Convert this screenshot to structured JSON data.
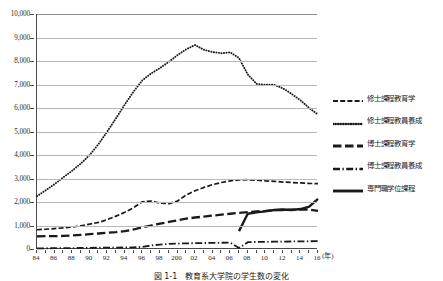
{
  "chart_data": {
    "type": "line",
    "title": "",
    "xlabel": "(年)",
    "ylabel": "",
    "ylim": [
      0,
      10000
    ],
    "ytick_values": [
      0,
      1000,
      2000,
      3000,
      4000,
      5000,
      6000,
      7000,
      8000,
      9000,
      10000
    ],
    "ytick_labels": [
      "0",
      "1,000",
      "2,000",
      "3,000",
      "4,000",
      "5,000",
      "6,000",
      "7,000",
      "8,000",
      "9,000",
      "10,000"
    ],
    "grid": true,
    "legend_position": "right",
    "x": [
      1984,
      1985,
      1986,
      1987,
      1988,
      1989,
      1990,
      1991,
      1992,
      1993,
      1994,
      1995,
      1996,
      1997,
      1998,
      1999,
      2000,
      2001,
      2002,
      2003,
      2004,
      2005,
      2006,
      2007,
      2008,
      2009,
      2010,
      2011,
      2012,
      2013,
      2014,
      2015,
      2016
    ],
    "xtick_labels": [
      "84",
      "86",
      "88",
      "90",
      "92",
      "94",
      "96",
      "98",
      "200",
      "02",
      "04",
      "06",
      "08",
      "10",
      "12",
      "14",
      "16"
    ],
    "xtick_years": [
      1984,
      1986,
      1988,
      1990,
      1992,
      1994,
      1996,
      1998,
      2000,
      2002,
      2004,
      2006,
      2008,
      2010,
      2012,
      2014,
      2016
    ],
    "series": [
      {
        "name": "修士課程教育学",
        "style": "dashed",
        "values": [
          820,
          840,
          870,
          900,
          930,
          990,
          1060,
          1130,
          1250,
          1400,
          1560,
          1760,
          2010,
          2040,
          1950,
          1930,
          2040,
          2300,
          2480,
          2620,
          2740,
          2830,
          2900,
          2940,
          2950,
          2930,
          2900,
          2880,
          2850,
          2830,
          2810,
          2790,
          2780
        ]
      },
      {
        "name": "修士課程教員養成",
        "style": "dotted",
        "values": [
          2250,
          2500,
          2760,
          3050,
          3330,
          3640,
          4000,
          4460,
          5000,
          5560,
          6150,
          6700,
          7180,
          7470,
          7700,
          7960,
          8250,
          8500,
          8680,
          8480,
          8380,
          8330,
          8370,
          8130,
          7430,
          7030,
          6990,
          6990,
          6840,
          6600,
          6330,
          6000,
          5720
        ]
      },
      {
        "name": "博士課程教育学",
        "style": "longdash",
        "values": [
          540,
          545,
          550,
          555,
          575,
          600,
          630,
          660,
          690,
          720,
          760,
          830,
          920,
          1000,
          1080,
          1150,
          1220,
          1290,
          1340,
          1380,
          1420,
          1460,
          1500,
          1540,
          1570,
          1600,
          1620,
          1650,
          1660,
          1670,
          1680,
          1680,
          1620
        ]
      },
      {
        "name": "博士課程教員養成",
        "style": "dashdot",
        "values": [
          30,
          30,
          35,
          35,
          40,
          45,
          50,
          55,
          60,
          60,
          65,
          70,
          90,
          150,
          190,
          215,
          230,
          240,
          250,
          255,
          260,
          265,
          270,
          40,
          290,
          300,
          305,
          310,
          315,
          320,
          325,
          330,
          335
        ]
      },
      {
        "name": "専門職学位課程",
        "style": "solid",
        "values": [
          null,
          null,
          null,
          null,
          null,
          null,
          null,
          null,
          null,
          null,
          null,
          null,
          null,
          null,
          null,
          null,
          null,
          null,
          null,
          null,
          null,
          null,
          null,
          760,
          1500,
          1560,
          1600,
          1660,
          1680,
          1660,
          1700,
          1800,
          2130
        ]
      }
    ]
  },
  "legend": {
    "items": [
      {
        "label": "修士課程教育学",
        "style": "dashed"
      },
      {
        "label": "修士課程教員養成",
        "style": "dotted"
      },
      {
        "label": "博士課程教育学",
        "style": "longdash"
      },
      {
        "label": "博士課程教員養成",
        "style": "dashdot"
      },
      {
        "label": "専門職学位課程",
        "style": "solid"
      }
    ]
  },
  "caption": {
    "text": "図 1-1　教育系大学院の学生数の変化"
  },
  "colors": {
    "line": "#1a1a1a",
    "grid": "#b9b9b9",
    "axis": "#4a4a4a"
  }
}
